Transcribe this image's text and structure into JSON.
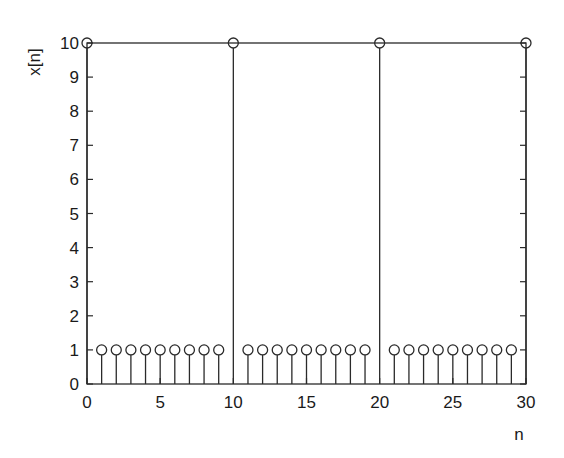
{
  "chart_data": {
    "type": "stem",
    "title": "",
    "xlabel": "n",
    "ylabel": "x[n]",
    "xlim": [
      0,
      30
    ],
    "ylim": [
      0,
      10
    ],
    "xticks": [
      0,
      5,
      10,
      15,
      20,
      25,
      30
    ],
    "yticks": [
      0,
      1,
      2,
      3,
      4,
      5,
      6,
      7,
      8,
      9,
      10
    ],
    "grid": false,
    "box": true,
    "marker": "open-circle",
    "x": [
      0,
      1,
      2,
      3,
      4,
      5,
      6,
      7,
      8,
      9,
      10,
      11,
      12,
      13,
      14,
      15,
      16,
      17,
      18,
      19,
      20,
      21,
      22,
      23,
      24,
      25,
      26,
      27,
      28,
      29,
      30
    ],
    "values": [
      10,
      1,
      1,
      1,
      1,
      1,
      1,
      1,
      1,
      1,
      10,
      1,
      1,
      1,
      1,
      1,
      1,
      1,
      1,
      1,
      10,
      1,
      1,
      1,
      1,
      1,
      1,
      1,
      1,
      1,
      10
    ]
  },
  "colors": {
    "line": "#2a2a2a",
    "background": "#ffffff"
  }
}
